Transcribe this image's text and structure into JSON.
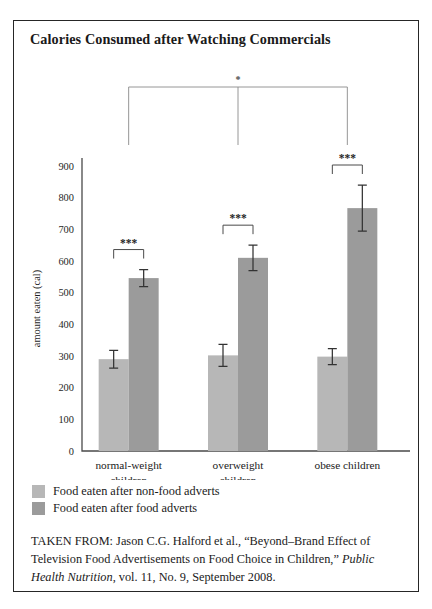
{
  "figure": {
    "title": "Calories Consumed after Watching Commercials",
    "source_prefix": "TAKEN FROM: Jason C.G. Halford et al., “Beyond–Brand Effect of Television Food Advertisements on Food Choice in Children,” ",
    "source_italic": "Public Health Nutrition",
    "source_suffix": ", vol. 11, No. 9, September 2008."
  },
  "colors": {
    "bar_light": "#b7b7b7",
    "bar_dark": "#9b9b9b",
    "axis": "#4a4a4a",
    "frame": "#262626",
    "text": "#1a1a1a"
  },
  "chart_data": {
    "type": "bar",
    "title": "Calories Consumed after Watching Commercials",
    "xlabel": "",
    "ylabel": "amount eaten (cal)",
    "ylim": [
      0,
      900
    ],
    "yticks": [
      0,
      100,
      200,
      300,
      400,
      500,
      600,
      700,
      800,
      900
    ],
    "ytick_labels": [
      "0",
      "100",
      "200",
      "300",
      "400",
      "500",
      "600",
      "700",
      "800",
      "900"
    ],
    "grid": false,
    "legend_position": "below-axes-left",
    "categories": [
      "normal-weight children",
      "overweight children",
      "obese children"
    ],
    "category_lines": [
      [
        "normal-weight",
        "children"
      ],
      [
        "overweight",
        "children"
      ],
      [
        "obese children"
      ]
    ],
    "series": [
      {
        "name": "Food eaten after non-food adverts",
        "color": "#b7b7b7",
        "values": [
          290,
          302,
          298
        ],
        "errors": [
          28,
          35,
          25
        ]
      },
      {
        "name": "Food eaten after food adverts",
        "color": "#9b9b9b",
        "values": [
          546,
          610,
          767
        ],
        "errors": [
          27,
          40,
          73
        ]
      }
    ],
    "annotations": [
      {
        "label": "***",
        "type": "bracket",
        "group": 0,
        "spans": [
          0,
          1
        ]
      },
      {
        "label": "***",
        "type": "bracket",
        "group": 1,
        "spans": [
          0,
          1
        ]
      },
      {
        "label": "***",
        "type": "bracket",
        "group": 2,
        "spans": [
          0,
          1
        ]
      },
      {
        "label": "*",
        "type": "bracket-wide",
        "spans": [
          "normal-weight children",
          "obese children"
        ]
      }
    ]
  },
  "legend": {
    "items": [
      {
        "label": "Food eaten after non-food adverts",
        "color": "#b7b7b7"
      },
      {
        "label": "Food eaten after food adverts",
        "color": "#9b9b9b"
      }
    ]
  }
}
